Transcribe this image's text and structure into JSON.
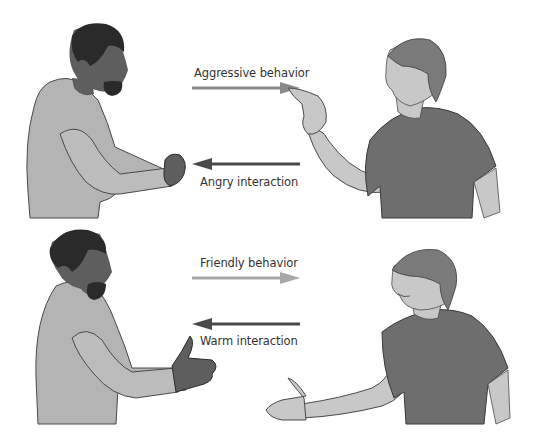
{
  "scenes": [
    {
      "id": "hostile",
      "outgoing": {
        "label": "Aggressive behavior",
        "direction": "right",
        "color": "#8a8a8a"
      },
      "returning": {
        "label": "Angry interaction",
        "direction": "left",
        "color": "#4a4a4a"
      },
      "left_figure": {
        "description": "man with raised fist",
        "gesture": "fist"
      },
      "right_figure": {
        "description": "boy pointing finger",
        "gesture": "pointing"
      }
    },
    {
      "id": "friendly",
      "outgoing": {
        "label": "Friendly behavior",
        "direction": "right",
        "color": "#a8a8a8"
      },
      "returning": {
        "label": "Warm interaction",
        "direction": "left",
        "color": "#4a4a4a"
      },
      "left_figure": {
        "description": "man extending hand",
        "gesture": "handshake"
      },
      "right_figure": {
        "description": "smiling boy extending hand",
        "gesture": "handshake"
      }
    }
  ],
  "colors": {
    "skin_dark": "#5e5e5e",
    "hair_dark": "#2a2a2a",
    "shirt_light": "#b4b4b4",
    "shirt_dark": "#6e6e6e",
    "skin_light": "#c8c8c8",
    "hair_light": "#7a7a7a",
    "outline": "#3a3a3a"
  }
}
